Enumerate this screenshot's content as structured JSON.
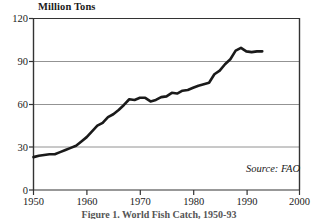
{
  "chart_data": {
    "type": "line",
    "title": "",
    "ylabel": "Million Tons",
    "xlabel": "",
    "ylim": [
      0,
      120
    ],
    "xlim": [
      1950,
      2000
    ],
    "yticks": [
      "0",
      "30",
      "60",
      "90",
      "120"
    ],
    "ytick_values": [
      0,
      30,
      60,
      90,
      120
    ],
    "xticks": [
      "1950",
      "1960",
      "1970",
      "1980",
      "1990",
      "2000"
    ],
    "xtick_values": [
      1950,
      1960,
      1970,
      1980,
      1990,
      2000
    ],
    "grid": true,
    "grid_axis": "y",
    "legend": null,
    "line_color": "#1a1a1a",
    "line_width": 2.6,
    "annotations": [
      {
        "name": "source",
        "text": "Source: FAO",
        "style": "italic",
        "position": "bottom-right"
      }
    ],
    "x": [
      1950,
      1951,
      1952,
      1953,
      1954,
      1955,
      1956,
      1957,
      1958,
      1959,
      1960,
      1961,
      1962,
      1963,
      1964,
      1965,
      1966,
      1967,
      1968,
      1969,
      1970,
      1971,
      1972,
      1973,
      1974,
      1975,
      1976,
      1977,
      1978,
      1979,
      1980,
      1981,
      1982,
      1983,
      1984,
      1985,
      1986,
      1987,
      1988,
      1989,
      1990,
      1991,
      1992,
      1993
    ],
    "values": [
      23,
      24,
      24.5,
      25,
      25,
      26.5,
      28,
      29.5,
      31,
      34,
      37,
      41,
      45,
      47,
      51,
      53,
      56,
      59.5,
      63.5,
      63,
      64.5,
      64.5,
      62,
      63,
      65,
      65.5,
      68,
      67.5,
      69.5,
      70,
      71.5,
      73,
      74,
      75,
      81,
      83.5,
      88,
      91.5,
      97.5,
      99.5,
      97,
      96.5,
      97,
      97
    ]
  },
  "caption": "Figure 1. World Fish Catch, 1950-93"
}
